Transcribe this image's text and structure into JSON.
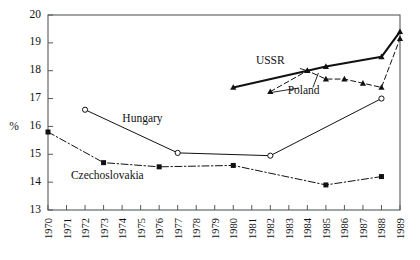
{
  "chart_data": {
    "type": "line",
    "title": "",
    "xlabel": "",
    "ylabel": "%",
    "xlim": [
      1970,
      1989
    ],
    "ylim": [
      13,
      20
    ],
    "grid": false,
    "legend": "inline-annotations",
    "x_ticks": [
      "1970",
      "1971",
      "1972",
      "1973",
      "1974",
      "1975",
      "1976",
      "1977",
      "1978",
      "1979",
      "1980",
      "1981",
      "1982",
      "1983",
      "1984",
      "1985",
      "1986",
      "1987",
      "1988",
      "1989"
    ],
    "y_ticks": [
      "13",
      "14",
      "15",
      "16",
      "17",
      "18",
      "19",
      "20"
    ],
    "series": [
      {
        "name": "Czechoslovakia",
        "marker": "filled-square",
        "line_style": "dash-dot",
        "color": "#111111",
        "x": [
          1970,
          1973,
          1976,
          1980,
          1985,
          1988
        ],
        "values": [
          15.8,
          14.7,
          14.55,
          14.6,
          13.9,
          14.2
        ]
      },
      {
        "name": "Hungary",
        "marker": "open-circle",
        "line_style": "solid",
        "color": "#111111",
        "x": [
          1972,
          1977,
          1982,
          1988
        ],
        "values": [
          16.6,
          15.05,
          14.95,
          17.0
        ]
      },
      {
        "name": "USSR",
        "marker": "filled-triangle",
        "line_style": "solid-thick",
        "color": "#111111",
        "x": [
          1980,
          1984,
          1985,
          1988,
          1989
        ],
        "values": [
          17.4,
          18.0,
          18.15,
          18.5,
          19.4
        ]
      },
      {
        "name": "Poland",
        "marker": "filled-triangle",
        "line_style": "dashed",
        "color": "#111111",
        "x": [
          1982,
          1984,
          1985,
          1986,
          1987,
          1988,
          1989
        ],
        "values": [
          17.25,
          18.0,
          17.7,
          17.7,
          17.55,
          17.4,
          19.15
        ]
      }
    ],
    "annotations": [
      {
        "label": "USSR",
        "x_value": 1982.0,
        "y_value": 18.25
      },
      {
        "label": "Poland",
        "x_value": 1983.8,
        "y_value": 17.15
      },
      {
        "label": "Hungary",
        "x_value": 1975.1,
        "y_value": 16.15
      },
      {
        "label": "Czechoslovakia",
        "x_value": 1973.2,
        "y_value": 14.1
      }
    ]
  }
}
